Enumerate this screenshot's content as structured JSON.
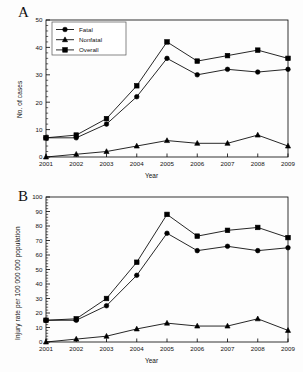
{
  "figure": {
    "background": "#fdfdfd",
    "line_color": "#000000",
    "axis_color": "#000000"
  },
  "panels": [
    {
      "letter": "A",
      "ylabel": "No. of cases",
      "xlabel": "Year",
      "legend": {
        "position": "top-left-inside",
        "items": [
          {
            "label": "Fatal",
            "marker": "circle"
          },
          {
            "label": "Nonfatal",
            "marker": "triangle"
          },
          {
            "label": "Overall",
            "marker": "square"
          }
        ]
      }
    },
    {
      "letter": "B",
      "ylabel": "Injury rate per 100 000 000 population",
      "xlabel": "Year",
      "legend": {
        "position": "none",
        "items": []
      }
    }
  ],
  "chart_data": [
    {
      "type": "line",
      "title": "A",
      "xlabel": "Year",
      "ylabel": "No. of cases",
      "categories": [
        "2001",
        "2002",
        "2003",
        "2004",
        "2005",
        "2006",
        "2007",
        "2008",
        "2009"
      ],
      "x": [
        2001,
        2002,
        2003,
        2004,
        2005,
        2006,
        2007,
        2008,
        2009
      ],
      "ylim": [
        0,
        50
      ],
      "ytick_step": 10,
      "yticks": [
        0,
        10,
        20,
        30,
        40,
        50
      ],
      "grid": false,
      "legend_position": "upper left",
      "series": [
        {
          "name": "Fatal",
          "marker": "circle",
          "values": [
            7,
            7,
            12,
            22,
            36,
            30,
            32,
            31,
            32
          ]
        },
        {
          "name": "Nonfatal",
          "marker": "triangle",
          "values": [
            0,
            1,
            2,
            4,
            6,
            5,
            5,
            8,
            4
          ]
        },
        {
          "name": "Overall",
          "marker": "square",
          "values": [
            7,
            8,
            14,
            26,
            42,
            35,
            37,
            39,
            36
          ]
        }
      ]
    },
    {
      "type": "line",
      "title": "B",
      "xlabel": "Year",
      "ylabel": "Injury rate per 100 000 000 population",
      "categories": [
        "2001",
        "2002",
        "2003",
        "2004",
        "2005",
        "2006",
        "2007",
        "2008",
        "2009"
      ],
      "x": [
        2001,
        2002,
        2003,
        2004,
        2005,
        2006,
        2007,
        2008,
        2009
      ],
      "ylim": [
        0,
        100
      ],
      "ytick_step": 10,
      "yticks": [
        0,
        10,
        20,
        30,
        40,
        50,
        60,
        70,
        80,
        90,
        100
      ],
      "grid": false,
      "legend_position": "none",
      "series": [
        {
          "name": "Fatal",
          "marker": "circle",
          "values": [
            15,
            15,
            25,
            46,
            75,
            63,
            66,
            63,
            65
          ]
        },
        {
          "name": "Nonfatal",
          "marker": "triangle",
          "values": [
            0,
            2,
            4,
            9,
            13,
            11,
            11,
            16,
            8
          ]
        },
        {
          "name": "Overall",
          "marker": "square",
          "values": [
            15,
            16,
            30,
            55,
            88,
            73,
            77,
            79,
            72
          ]
        }
      ]
    }
  ]
}
